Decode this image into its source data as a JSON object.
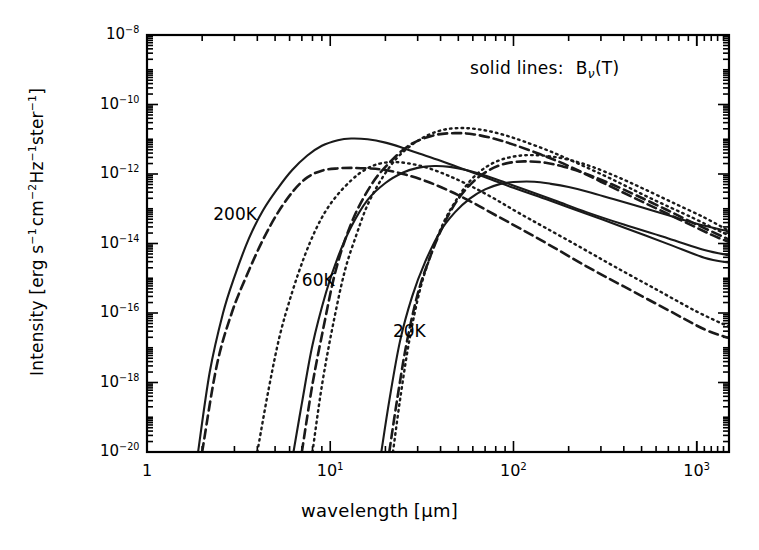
{
  "figure": {
    "xlabel_text": "wavelength",
    "xlabel_unit": "[μm]",
    "ylabel": "Intensity [erg s⁻¹ cm⁻² Hz⁻¹ ster⁻¹]",
    "legend": {
      "prefix": "solid lines:",
      "symbol_base": "B",
      "symbol_sub": "ν",
      "symbol_arg": "(T)"
    },
    "axis_color": "#000000",
    "curve_color": "#1a1a1a"
  },
  "chart_data": {
    "type": "line",
    "title": "",
    "xlabel": "wavelength [μm]",
    "ylabel": "Intensity [erg s^-1 cm^-2 Hz^-1 ster^-1]",
    "xscale": "log",
    "yscale": "log",
    "xlim": [
      1,
      1500
    ],
    "ylim": [
      1e-20,
      1e-08
    ],
    "grid": false,
    "legend_position": "top-right-inside",
    "xticks": [
      {
        "value": 1,
        "label": "1"
      },
      {
        "value": 10,
        "label": "10",
        "exp": "1"
      },
      {
        "value": 100,
        "label": "10",
        "exp": "2"
      },
      {
        "value": 1000,
        "label": "10",
        "exp": "3"
      }
    ],
    "yticks": [
      {
        "value": 1e-08,
        "mantissa": "10",
        "exp": "-8"
      },
      {
        "value": 1e-10,
        "mantissa": "10",
        "exp": "-10"
      },
      {
        "value": 1e-12,
        "mantissa": "10",
        "exp": "-12"
      },
      {
        "value": 1e-14,
        "mantissa": "10",
        "exp": "-14"
      },
      {
        "value": 1e-16,
        "mantissa": "10",
        "exp": "-16"
      },
      {
        "value": 1e-18,
        "mantissa": "10",
        "exp": "-18"
      },
      {
        "value": 1e-20,
        "mantissa": "10",
        "exp": "-20"
      }
    ],
    "annotations": [
      {
        "text": "200K",
        "x": 2.3,
        "y": 7e-14
      },
      {
        "text": "60K",
        "x": 7.0,
        "y": 9e-16
      },
      {
        "text": "20K",
        "x": 22,
        "y": 3e-17
      },
      {
        "text": "solid lines:  Bν(T)",
        "x": 120,
        "y": 1.4e-09
      }
    ],
    "series": [
      {
        "name": "B_nu(200K)",
        "temperature": 200,
        "style": "solid",
        "x": [
          1.9,
          2.2,
          2.6,
          3.0,
          3.6,
          4.3,
          5.2,
          6.2,
          7.5,
          9.0,
          11,
          13,
          16,
          20,
          25,
          30,
          40,
          55,
          75,
          100,
          150,
          250,
          400,
          700,
          1100,
          1500
        ],
        "y": [
          1e-20,
          2e-18,
          1e-16,
          1.1e-15,
          1.4e-14,
          9e-14,
          4e-13,
          1.3e-12,
          3.4e-12,
          6.5e-12,
          9.4e-12,
          1.05e-11,
          1e-11,
          8e-12,
          5.6e-12,
          4e-12,
          2.4e-12,
          1.3e-12,
          7.1e-13,
          4e-13,
          1.9e-13,
          7.2e-14,
          2.9e-14,
          9.6e-15,
          3.9e-15,
          2.8e-15
        ]
      },
      {
        "name": "B_nu(60K)",
        "temperature": 60,
        "style": "solid",
        "x": [
          6.3,
          7.0,
          8.0,
          9.5,
          11,
          13,
          16,
          20,
          25,
          30,
          37,
          45,
          55,
          70,
          90,
          120,
          170,
          250,
          400,
          700,
          1100,
          1500
        ],
        "y": [
          1e-20,
          2.5e-19,
          1.2e-17,
          4e-16,
          4e-15,
          3e-14,
          1.8e-13,
          5.5e-13,
          1.1e-12,
          1.5e-12,
          1.7e-12,
          1.6e-12,
          1.3e-12,
          9e-13,
          5.7e-13,
          3.3e-13,
          1.7e-13,
          8e-14,
          3.5e-14,
          1.4e-14,
          6.5e-15,
          4.6e-15
        ]
      },
      {
        "name": "B_nu(20K)",
        "temperature": 20,
        "style": "solid",
        "x": [
          19,
          21,
          24,
          28,
          33,
          40,
          48,
          58,
          70,
          85,
          100,
          130,
          160,
          200,
          260,
          350,
          500,
          700,
          1000,
          1500
        ],
        "y": [
          1e-20,
          3e-19,
          1.5e-17,
          3e-16,
          3e-15,
          2.3e-14,
          8e-14,
          2e-13,
          3.6e-13,
          5.2e-13,
          5.9e-13,
          6e-13,
          5.2e-13,
          4.2e-13,
          3e-13,
          1.9e-13,
          1.1e-13,
          6.5e-14,
          3.7e-14,
          2.2e-14
        ]
      },
      {
        "name": "dust emission 200K (dashed)",
        "temperature": 200,
        "style": "dashed",
        "x": [
          2.0,
          2.4,
          2.9,
          3.5,
          4.3,
          5.2,
          6.3,
          7.5,
          9.0,
          11,
          13,
          16,
          20,
          26,
          34,
          45,
          60,
          80,
          110,
          160,
          250,
          400,
          700,
          1100,
          1500
        ],
        "y": [
          1e-20,
          3e-18,
          1e-16,
          1.2e-15,
          1.3e-14,
          8e-14,
          3.3e-13,
          8e-13,
          1.25e-12,
          1.45e-12,
          1.5e-12,
          1.45e-12,
          1.3e-12,
          9.5e-13,
          6e-13,
          3.2e-13,
          1.5e-13,
          6.5e-14,
          2.6e-14,
          8.6e-15,
          2.2e-15,
          5.8e-16,
          1.2e-16,
          3.4e-17,
          1.9e-17
        ]
      },
      {
        "name": "dust emission 200K (dotted)",
        "temperature": 200,
        "style": "dotted",
        "x": [
          4.0,
          4.6,
          5.3,
          6.2,
          7.2,
          8.3,
          9.5,
          11,
          13,
          15,
          18,
          22,
          27,
          34,
          44,
          58,
          78,
          105,
          150,
          230,
          360,
          600,
          1000,
          1500
        ],
        "y": [
          1e-20,
          6e-19,
          2.2e-17,
          4e-16,
          4e-15,
          2.4e-14,
          9e-14,
          2.6e-13,
          6.5e-13,
          1.2e-12,
          1.9e-12,
          2.2e-12,
          2e-12,
          1.5e-12,
          9e-13,
          4.6e-13,
          2e-13,
          8e-14,
          2.8e-14,
          8e-15,
          2.1e-15,
          4.8e-16,
          1.1e-16,
          4e-17
        ]
      },
      {
        "name": "dust emission 60K (dashed)",
        "temperature": 60,
        "style": "dashed",
        "x": [
          7.0,
          8.0,
          9.2,
          10.5,
          12,
          14,
          17,
          20,
          25,
          30,
          38,
          48,
          60,
          78,
          100,
          140,
          200,
          300,
          480,
          800,
          1200,
          1500
        ],
        "y": [
          1e-20,
          9e-19,
          4e-17,
          1.1e-15,
          1.2e-14,
          9e-14,
          5.5e-13,
          1.6e-12,
          5e-12,
          9e-12,
          1.35e-11,
          1.5e-11,
          1.4e-11,
          1.05e-11,
          7e-12,
          3.7e-12,
          1.7e-12,
          6e-13,
          1.8e-13,
          5e-14,
          1.8e-14,
          1.1e-14
        ]
      },
      {
        "name": "dust emission 60K (dotted)",
        "temperature": 60,
        "style": "dotted",
        "x": [
          8.0,
          9.0,
          10.3,
          12,
          14,
          16,
          19,
          23,
          28,
          34,
          42,
          53,
          68,
          88,
          115,
          160,
          230,
          350,
          560,
          950,
          1400,
          1500
        ],
        "y": [
          1e-20,
          8e-19,
          4e-17,
          1.6e-15,
          2e-14,
          1.3e-13,
          7e-13,
          2.8e-12,
          7e-12,
          1.3e-11,
          1.9e-11,
          2.1e-11,
          1.85e-11,
          1.35e-11,
          8.5e-12,
          4.4e-12,
          1.9e-12,
          6.8e-13,
          2e-13,
          5.5e-14,
          2e-14,
          1.8e-14
        ]
      },
      {
        "name": "dust emission 20K (dashed)",
        "temperature": 20,
        "style": "dashed",
        "x": [
          21,
          23,
          26,
          30,
          35,
          41,
          48,
          57,
          68,
          82,
          100,
          120,
          150,
          190,
          250,
          340,
          470,
          680,
          1000,
          1500
        ],
        "y": [
          1e-20,
          2.5e-19,
          1.2e-17,
          3.5e-16,
          4e-15,
          3e-14,
          1.4e-13,
          4.5e-13,
          1e-12,
          1.7e-12,
          2.2e-12,
          2.3e-12,
          2.1e-12,
          1.6e-12,
          1e-12,
          5.2e-13,
          2.4e-13,
          9.5e-14,
          3.5e-14,
          1.3e-14
        ]
      },
      {
        "name": "dust emission 20K (dotted)",
        "temperature": 20,
        "style": "dotted",
        "x": [
          22,
          24,
          27,
          31,
          36,
          42,
          50,
          59,
          71,
          86,
          105,
          128,
          160,
          205,
          270,
          370,
          510,
          740,
          1100,
          1500
        ],
        "y": [
          1e-20,
          3e-19,
          1.6e-17,
          5e-16,
          6e-15,
          4.5e-14,
          2.2e-13,
          7e-13,
          1.6e-12,
          2.6e-12,
          3.3e-12,
          3.5e-12,
          3.2e-12,
          2.5e-12,
          1.6e-12,
          8.2e-13,
          3.8e-13,
          1.5e-13,
          5.6e-14,
          2.3e-14
        ]
      }
    ]
  }
}
